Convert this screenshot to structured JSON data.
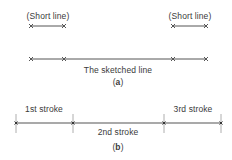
{
  "figure": {
    "part_a": {
      "short_line_left_label": "(Short line)",
      "short_line_right_label": "(Short line)",
      "sketched_line_label": "The sketched line",
      "caption_open": "(",
      "caption_letter": "a",
      "caption_close": ")"
    },
    "part_b": {
      "stroke1_label": "1st stroke",
      "stroke2_label": "2nd stroke",
      "stroke3_label": "3rd stroke",
      "caption_open": "(",
      "caption_letter": "b",
      "caption_close": ")"
    },
    "colors": {
      "line": "#555555",
      "text": "#3a3a3a",
      "background": "#ffffff"
    }
  }
}
